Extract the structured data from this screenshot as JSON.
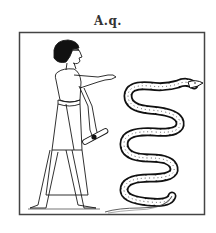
{
  "figure": {
    "caption": "A.q.",
    "elements": {
      "frame": "square-border",
      "figure": "egyptian-man",
      "held_object": "scroll",
      "animal": "spotted-serpent"
    },
    "colors": {
      "ink": "#1a1a1a",
      "paper": "#ffffff",
      "frame": "#444444"
    }
  }
}
